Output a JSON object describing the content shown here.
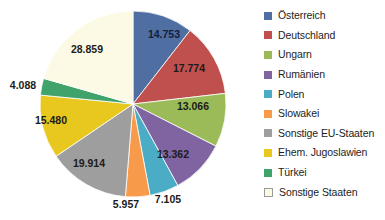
{
  "chart_data": {
    "type": "pie",
    "title": "",
    "subtitle": "",
    "xlabel": "",
    "ylabel": "",
    "legend_position": "right",
    "grid": false,
    "label_format": "german-thousands-dot",
    "total": 140358,
    "start_angle_deg": 0,
    "direction": "clockwise",
    "categories": [
      "Österreich",
      "Deutschland",
      "Ungarn",
      "Rumänien",
      "Polen",
      "Slowakei",
      "Sonstige EU-Staaten",
      "Ehem. Jugoslawien",
      "Türkei",
      "Sonstige Staaten"
    ],
    "values": [
      14753,
      17774,
      13066,
      13362,
      7105,
      5957,
      19914,
      15480,
      4088,
      28859
    ],
    "value_labels": [
      "14.753",
      "17.774",
      "13.066",
      "13.362",
      "7.105",
      "5.957",
      "19.914",
      "15.480",
      "4.088",
      "28.859"
    ],
    "colors": [
      "#4F6FA3",
      "#C0504D",
      "#9BBB59",
      "#8064A2",
      "#4BACC6",
      "#F79B4A",
      "#9E9E9E",
      "#E8C81E",
      "#41A36C",
      "#FCFAE4"
    ],
    "slices": [
      {
        "label": "Österreich",
        "value": 14753,
        "display": "14.753",
        "color": "#4F6FA3",
        "label_inside": true,
        "label_color": "dark-blue"
      },
      {
        "label": "Deutschland",
        "value": 17774,
        "display": "17.774",
        "color": "#C0504D",
        "label_inside": true,
        "label_color": "dark"
      },
      {
        "label": "Ungarn",
        "value": 13066,
        "display": "13.066",
        "color": "#9BBB59",
        "label_inside": true,
        "label_color": "dark"
      },
      {
        "label": "Rumänien",
        "value": 13362,
        "display": "13.362",
        "color": "#8064A2",
        "label_inside": true,
        "label_color": "dark"
      },
      {
        "label": "Polen",
        "value": 7105,
        "display": "7.105",
        "color": "#4BACC6",
        "label_inside": false,
        "label_color": "dark"
      },
      {
        "label": "Slowakei",
        "value": 5957,
        "display": "5.957",
        "color": "#F79B4A",
        "label_inside": false,
        "label_color": "dark"
      },
      {
        "label": "Sonstige EU-Staaten",
        "value": 19914,
        "display": "19.914",
        "color": "#9E9E9E",
        "label_inside": true,
        "label_color": "dark"
      },
      {
        "label": "Ehem. Jugoslawien",
        "value": 15480,
        "display": "15.480",
        "color": "#E8C81E",
        "label_inside": true,
        "label_color": "dark"
      },
      {
        "label": "Türkei",
        "value": 4088,
        "display": "4.088",
        "color": "#41A36C",
        "label_inside": false,
        "label_color": "dark"
      },
      {
        "label": "Sonstige Staaten",
        "value": 28859,
        "display": "28.859",
        "color": "#FCFAE4",
        "label_inside": true,
        "label_color": "dark"
      }
    ]
  },
  "legend": {
    "items": [
      {
        "label": "Österreich",
        "color": "#4F6FA3",
        "outlined": false
      },
      {
        "label": "Deutschland",
        "color": "#C0504D",
        "outlined": false
      },
      {
        "label": "Ungarn",
        "color": "#9BBB59",
        "outlined": false
      },
      {
        "label": "Rumänien",
        "color": "#8064A2",
        "outlined": false
      },
      {
        "label": "Polen",
        "color": "#4BACC6",
        "outlined": false
      },
      {
        "label": "Slowakei",
        "color": "#F79B4A",
        "outlined": false
      },
      {
        "label": "Sonstige EU-Staaten",
        "color": "#9E9E9E",
        "outlined": false
      },
      {
        "label": "Ehem. Jugoslawien",
        "color": "#E8C81E",
        "outlined": false
      },
      {
        "label": "Türkei",
        "color": "#41A36C",
        "outlined": false
      },
      {
        "label": "Sonstige Staaten",
        "color": "#FCFAE4",
        "outlined": true
      }
    ]
  },
  "geometry": {
    "center_x": 133,
    "center_y": 104,
    "radius": 93,
    "label_positions": [
      {
        "x": 164,
        "y": 38,
        "anchor": "middle"
      },
      {
        "x": 189,
        "y": 72,
        "anchor": "middle"
      },
      {
        "x": 193,
        "y": 110,
        "anchor": "middle"
      },
      {
        "x": 173,
        "y": 158,
        "anchor": "middle"
      },
      {
        "x": 168,
        "y": 203,
        "anchor": "middle"
      },
      {
        "x": 126,
        "y": 208,
        "anchor": "middle"
      },
      {
        "x": 89,
        "y": 167,
        "anchor": "middle"
      },
      {
        "x": 51,
        "y": 124,
        "anchor": "middle"
      },
      {
        "x": 23,
        "y": 89,
        "anchor": "middle"
      },
      {
        "x": 87,
        "y": 53,
        "anchor": "middle"
      }
    ]
  }
}
